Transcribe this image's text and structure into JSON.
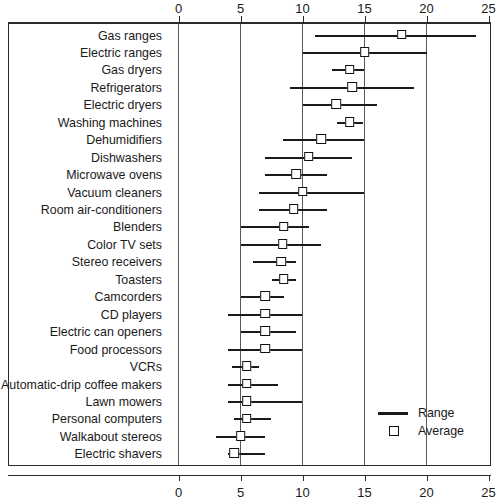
{
  "chart_data": {
    "type": "scatter",
    "title": "",
    "xlabel": "",
    "ylabel": "",
    "xlim": [
      0,
      25
    ],
    "grid": true,
    "legend_position": "bottom-right",
    "axis": {
      "ticks": [
        0,
        5,
        10,
        15,
        20,
        25
      ],
      "tick_labels": [
        "0",
        "5",
        "10",
        "15",
        "20",
        "25"
      ],
      "top_axis": true,
      "bottom_axis": true
    },
    "legend": [
      {
        "key": "range",
        "label": "Range",
        "glyph": "line"
      },
      {
        "key": "average",
        "label": "Average",
        "glyph": "square"
      }
    ],
    "categories": [
      "Gas ranges",
      "Electric ranges",
      "Gas dryers",
      "Refrigerators",
      "Electric dryers",
      "Washing machines",
      "Dehumidifiers",
      "Dishwashers",
      "Microwave ovens",
      "Vacuum cleaners",
      "Room air-conditioners",
      "Blenders",
      "Color TV sets",
      "Stereo receivers",
      "Toasters",
      "Camcorders",
      "CD players",
      "Electric can openers",
      "Food processors",
      "VCRs",
      "Automatic-drip coffee makers",
      "Lawn mowers",
      "Personal computers",
      "Walkabout stereos",
      "Electric shavers"
    ],
    "rows": [
      {
        "label": "Gas ranges",
        "low": 11.0,
        "high": 24.0,
        "average": 18.0
      },
      {
        "label": "Electric ranges",
        "low": 10.0,
        "high": 20.0,
        "average": 15.0
      },
      {
        "label": "Gas dryers",
        "low": 12.4,
        "high": 15.0,
        "average": 13.8
      },
      {
        "label": "Refrigerators",
        "low": 9.0,
        "high": 19.0,
        "average": 14.0
      },
      {
        "label": "Electric dryers",
        "low": 10.0,
        "high": 16.0,
        "average": 12.7
      },
      {
        "label": "Washing machines",
        "low": 12.8,
        "high": 14.9,
        "average": 13.8
      },
      {
        "label": "Dehumidifiers",
        "low": 8.4,
        "high": 15.0,
        "average": 11.5
      },
      {
        "label": "Dishwashers",
        "low": 7.0,
        "high": 14.0,
        "average": 10.5
      },
      {
        "label": "Microwave ovens",
        "low": 7.0,
        "high": 12.0,
        "average": 9.5
      },
      {
        "label": "Vacuum cleaners",
        "low": 6.5,
        "high": 15.0,
        "average": 10.0
      },
      {
        "label": "Room air-conditioners",
        "low": 6.5,
        "high": 12.0,
        "average": 9.3
      },
      {
        "label": "Blenders",
        "low": 5.0,
        "high": 10.5,
        "average": 8.5
      },
      {
        "label": "Color TV sets",
        "low": 5.0,
        "high": 11.5,
        "average": 8.4
      },
      {
        "label": "Stereo receivers",
        "low": 6.0,
        "high": 9.5,
        "average": 8.3
      },
      {
        "label": "Toasters",
        "low": 7.5,
        "high": 9.5,
        "average": 8.5
      },
      {
        "label": "Camcorders",
        "low": 5.0,
        "high": 8.5,
        "average": 7.0
      },
      {
        "label": "CD players",
        "low": 4.0,
        "high": 10.0,
        "average": 7.0
      },
      {
        "label": "Electric can openers",
        "low": 5.0,
        "high": 9.5,
        "average": 7.0
      },
      {
        "label": "Food processors",
        "low": 4.0,
        "high": 10.0,
        "average": 7.0
      },
      {
        "label": "VCRs",
        "low": 4.3,
        "high": 6.5,
        "average": 5.5
      },
      {
        "label": "Automatic-drip coffee makers",
        "low": 4.0,
        "high": 8.0,
        "average": 5.5
      },
      {
        "label": "Lawn mowers",
        "low": 4.0,
        "high": 10.0,
        "average": 5.5
      },
      {
        "label": "Personal computers",
        "low": 4.5,
        "high": 7.5,
        "average": 5.5
      },
      {
        "label": "Walkabout stereos",
        "low": 3.0,
        "high": 7.0,
        "average": 5.0
      },
      {
        "label": "Electric shavers",
        "low": 4.0,
        "high": 7.0,
        "average": 4.5
      }
    ]
  }
}
